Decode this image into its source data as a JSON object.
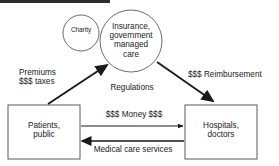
{
  "diagram": {
    "top_bar": {
      "name": "top-edge-artifact",
      "color": "#2b2b2b"
    },
    "colors": {
      "stroke": "#4d4d4d",
      "arrow_dark": "#1a1a1a",
      "text": "#1a1a1a",
      "background": "#ffffff"
    },
    "nodes": [
      {
        "id": "charity",
        "shape": "circle",
        "label": "Charity",
        "cx": 81,
        "cy": 33,
        "r": 18
      },
      {
        "id": "insurance",
        "shape": "circle",
        "label": "Insurance,\ngovernment\nmanaged\ncare",
        "cx": 131,
        "cy": 41,
        "r": 31
      },
      {
        "id": "patients",
        "shape": "rect",
        "label": "Patients,\npublic",
        "x": 8,
        "y": 105,
        "w": 72,
        "h": 54
      },
      {
        "id": "hospitals",
        "shape": "rect",
        "label": "Hospitals,\ndoctors",
        "x": 185,
        "y": 105,
        "w": 72,
        "h": 54
      }
    ],
    "edges": [
      {
        "id": "premiums",
        "label": "Premiums\n$$$ taxes",
        "from": "patients",
        "to": "insurance",
        "direction": "up-right"
      },
      {
        "id": "reimbursement",
        "label": "$$$ Reimbursement",
        "from": "insurance",
        "to": "hospitals",
        "direction": "down-right"
      },
      {
        "id": "regulations",
        "label": "Regulations",
        "from": "insurance",
        "to": "",
        "direction": "none"
      },
      {
        "id": "money",
        "label": "$$$ Money $$$",
        "from": "patients",
        "to": "hospitals",
        "direction": "right"
      },
      {
        "id": "services",
        "label": "Medical care services",
        "from": "hospitals",
        "to": "patients",
        "direction": "left"
      }
    ]
  }
}
